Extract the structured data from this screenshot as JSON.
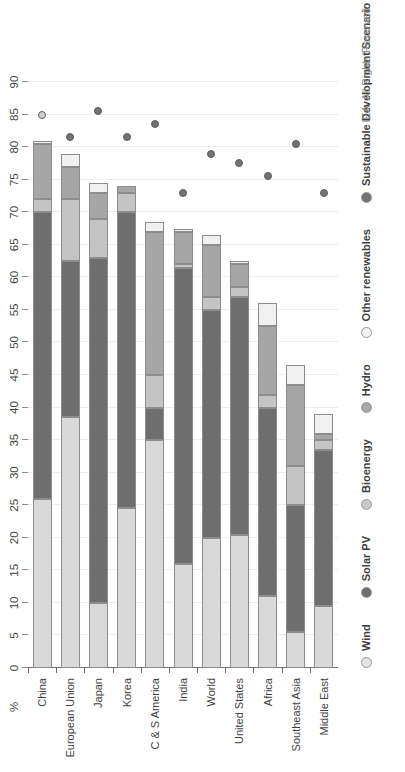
{
  "unit_label": "%",
  "copyright": "IEA. All Rights Reserved",
  "colors": {
    "wind": "#d9d9d9",
    "solar_pv": "#6e6e6e",
    "bioenergy": "#c4c4c4",
    "hydro": "#a6a6a6",
    "other_renewables": "#f0f0f0",
    "sds_marker": "#737373",
    "axis": "#6e6e6e",
    "grid": "#ededed",
    "text": "#3f3f3f"
  },
  "legend": [
    {
      "label": "Wind",
      "key": "wind",
      "swatch": "#e3e3e3"
    },
    {
      "label": "Solar PV",
      "key": "solar_pv",
      "swatch": "#6e6e6e"
    },
    {
      "label": "Bioenergy",
      "key": "bioenergy",
      "swatch": "#c9c9c9"
    },
    {
      "label": "Hydro",
      "key": "hydro",
      "swatch": "#a6a6a6"
    },
    {
      "label": "Other renewables",
      "key": "other_renewables",
      "swatch": "#f2f2f2"
    },
    {
      "label": "Sustainable Development Scenario",
      "key": "sds",
      "swatch": "#737373"
    }
  ],
  "chart_data": {
    "type": "bar",
    "stacked": true,
    "title": "",
    "subtitle": "",
    "xlabel": "",
    "ylabel": "%",
    "ylim": [
      0,
      90
    ],
    "ytick_step": 5,
    "yticks": [
      0,
      5,
      10,
      15,
      20,
      25,
      30,
      35,
      40,
      45,
      50,
      55,
      60,
      65,
      70,
      75,
      80,
      85,
      90
    ],
    "grid": true,
    "legend_position": "bottom",
    "orientation": "vertical-bars-rotated",
    "categories": [
      "China",
      "European Union",
      "Japan",
      "Korea",
      "C & S America",
      "India",
      "World",
      "United States",
      "Africa",
      "Southeast Asia",
      "Middle East"
    ],
    "series": [
      {
        "name": "Wind",
        "values": [
          26.0,
          38.5,
          10.0,
          24.5,
          35.0,
          16.0,
          20.0,
          20.5,
          11.0,
          5.5,
          9.5
        ]
      },
      {
        "name": "Solar PV",
        "values": [
          44.0,
          24.0,
          53.0,
          45.5,
          5.0,
          45.5,
          35.0,
          36.5,
          29.0,
          19.5,
          24.0
        ]
      },
      {
        "name": "Bioenergy",
        "values": [
          2.0,
          9.5,
          6.0,
          3.0,
          5.0,
          0.5,
          2.0,
          1.5,
          2.0,
          6.0,
          1.5
        ]
      },
      {
        "name": "Hydro",
        "values": [
          8.5,
          5.0,
          4.0,
          1.0,
          22.0,
          5.0,
          8.0,
          3.5,
          10.5,
          12.5,
          1.0
        ]
      },
      {
        "name": "Other renewables",
        "values": [
          0.5,
          2.0,
          1.5,
          0.0,
          1.5,
          0.5,
          1.5,
          0.5,
          3.5,
          3.0,
          3.0
        ]
      }
    ],
    "totals": [
      81.0,
      79.0,
      74.5,
      74.0,
      68.5,
      67.5,
      66.5,
      62.5,
      56.0,
      46.5,
      39.0
    ],
    "scenario_series": {
      "name": "Sustainable Development Scenario",
      "marker": "circle",
      "values": [
        85.0,
        81.5,
        85.5,
        81.5,
        83.5,
        73.0,
        79.0,
        77.5,
        75.5,
        80.5,
        73.0
      ]
    }
  }
}
